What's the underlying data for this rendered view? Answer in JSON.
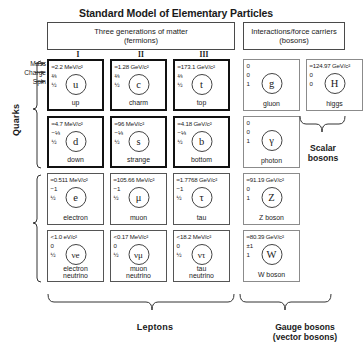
{
  "title": "Standard Model of Elementary Particles",
  "headers": {
    "fermions_line1": "Three generations of matter",
    "fermions_line2": "(fermions)",
    "bosons_line1": "Interactions/force carriers",
    "bosons_line2": "(bosons)"
  },
  "generations": [
    "I",
    "II",
    "III"
  ],
  "annotations": {
    "mass": "Mass",
    "charge": "Charge",
    "spin": "Spin"
  },
  "groups": {
    "quarks": "Quarks",
    "leptons": "Leptons",
    "scalar_line1": "Scalar",
    "scalar_line2": "bosons",
    "gauge_line1": "Gauge bosons",
    "gauge_line2": "(vector bosons)"
  },
  "colors": {
    "border_dark": "#111111",
    "border_mid": "#555555",
    "border_grey": "#8b8b8b",
    "text": "#1a1a1a",
    "background": "#ffffff"
  },
  "particles": {
    "up": {
      "mass": "≈2.2 MeV/c²",
      "charge": "⅔",
      "spin": "½",
      "symbol": "u",
      "name": "up"
    },
    "charm": {
      "mass": "≈1.28 GeV/c²",
      "charge": "⅔",
      "spin": "½",
      "symbol": "c",
      "name": "charm"
    },
    "top": {
      "mass": "≈173.1 GeV/c²",
      "charge": "⅔",
      "spin": "½",
      "symbol": "t",
      "name": "top"
    },
    "gluon": {
      "mass": "0",
      "charge": "0",
      "spin": "1",
      "symbol": "g",
      "name": "gluon"
    },
    "higgs": {
      "mass": "≈124.97 GeV/c²",
      "charge": "0",
      "spin": "0",
      "symbol": "H",
      "name": "higgs"
    },
    "down": {
      "mass": "≈4.7 MeV/c²",
      "charge": "−⅓",
      "spin": "½",
      "symbol": "d",
      "name": "down"
    },
    "strange": {
      "mass": "≈96 MeV/c²",
      "charge": "−⅓",
      "spin": "½",
      "symbol": "s",
      "name": "strange"
    },
    "bottom": {
      "mass": "≈4.18 GeV/c²",
      "charge": "−⅓",
      "spin": "½",
      "symbol": "b",
      "name": "bottom"
    },
    "photon": {
      "mass": "0",
      "charge": "0",
      "spin": "1",
      "symbol": "γ",
      "name": "photon"
    },
    "electron": {
      "mass": "≈0.511 MeV/c²",
      "charge": "−1",
      "spin": "½",
      "symbol": "e",
      "name": "electron"
    },
    "muon": {
      "mass": "≈105.66 MeV/c²",
      "charge": "−1",
      "spin": "½",
      "symbol": "μ",
      "name": "muon"
    },
    "tau": {
      "mass": "≈1.7768 GeV/c²",
      "charge": "−1",
      "spin": "½",
      "symbol": "τ",
      "name": "tau"
    },
    "zboson": {
      "mass": "≈91.19 GeV/c²",
      "charge": "0",
      "spin": "1",
      "symbol": "Z",
      "name": "Z boson"
    },
    "enu": {
      "mass": "<1.0 eV/c²",
      "charge": "0",
      "spin": "½",
      "symbol": "νe",
      "name_line1": "electron",
      "name_line2": "neutrino"
    },
    "munu": {
      "mass": "<0.17 MeV/c²",
      "charge": "0",
      "spin": "½",
      "symbol": "νμ",
      "name_line1": "muon",
      "name_line2": "neutrino"
    },
    "taunu": {
      "mass": "<18.2 MeV/c²",
      "charge": "0",
      "spin": "½",
      "symbol": "ντ",
      "name_line1": "tau",
      "name_line2": "neutrino"
    },
    "wboson": {
      "mass": "≈80.39 GeV/c²",
      "charge": "±1",
      "spin": "1",
      "symbol": "W",
      "name": "W boson"
    }
  }
}
